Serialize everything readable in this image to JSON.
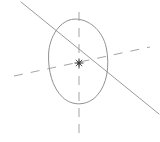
{
  "canvas": {
    "width": 160,
    "height": 142,
    "background": "#ffffff"
  },
  "chart_data": {
    "type": "scatter",
    "title": "",
    "subtitle": "",
    "xlabel": "",
    "ylabel": "",
    "grid": false,
    "legend_position": "none",
    "annotations": [],
    "tick_labels": [],
    "elements": [
      {
        "name": "ellipse-outline",
        "kind": "ellipse",
        "center_x": 78,
        "center_y": 62,
        "radius_x": 29,
        "radius_y": 43,
        "rotation_deg": -8,
        "stroke": "#8a8a8a",
        "stroke_width": 0.9,
        "fill": "none",
        "dashed": false
      },
      {
        "name": "vertical-dashed-axis",
        "kind": "line",
        "x1": 79,
        "y1": 12,
        "x2": 79,
        "y2": 133,
        "stroke": "#9a9a9a",
        "stroke_width": 0.9,
        "dashed": true,
        "dash_pattern": "9 7"
      },
      {
        "name": "horizontal-dashed-axis",
        "kind": "line",
        "x1": 14,
        "y1": 76,
        "x2": 150,
        "y2": 47,
        "stroke": "#9a9a9a",
        "stroke_width": 0.9,
        "dashed": true,
        "dash_pattern": "9 8"
      },
      {
        "name": "solid-diagonal-line",
        "kind": "line",
        "x1": 21,
        "y1": 2,
        "x2": 159,
        "y2": 114,
        "stroke": "#8f8f8f",
        "stroke_width": 0.9,
        "dashed": false
      },
      {
        "name": "center-point-marker",
        "kind": "point",
        "x": 79,
        "y": 63,
        "marker": "asterisk-dot",
        "color": "#3a3a3a",
        "size": 5
      }
    ],
    "x": [
      79
    ],
    "y": [
      63
    ],
    "values": [
      63
    ],
    "categories": [
      "center"
    ],
    "xlim": [
      0,
      160
    ],
    "ylim": [
      0,
      142
    ]
  },
  "colors": {
    "background": "#ffffff",
    "outline_stroke": "#8a8a8a",
    "dashed_stroke": "#9a9a9a",
    "solid_line_stroke": "#8f8f8f",
    "marker": "#3a3a3a"
  }
}
